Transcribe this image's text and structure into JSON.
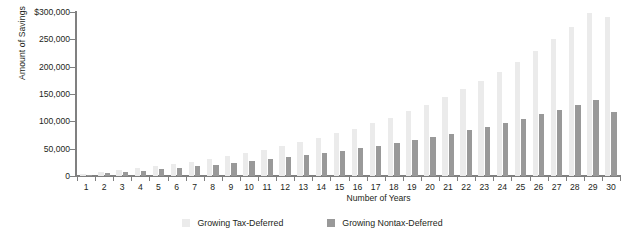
{
  "chart_data": {
    "type": "bar",
    "title": "",
    "xlabel": "Number of Years",
    "ylabel": "Amount of Savings",
    "ylim": [
      0,
      300000
    ],
    "ytick_labels": [
      "$300,000",
      "250,000",
      "200,000",
      "150,000",
      "100,000",
      "50,000",
      "0"
    ],
    "ytick_values": [
      300000,
      250000,
      200000,
      150000,
      100000,
      50000,
      0
    ],
    "grid": false,
    "legend_position": "bottom",
    "categories": [
      "1",
      "2",
      "3",
      "4",
      "5",
      "6",
      "7",
      "8",
      "9",
      "10",
      "11",
      "12",
      "13",
      "14",
      "15",
      "16",
      "17",
      "18",
      "19",
      "20",
      "21",
      "22",
      "23",
      "24",
      "25",
      "26",
      "27",
      "28",
      "29",
      "30"
    ],
    "series": [
      {
        "name": "Growing Tax-Deferred",
        "color": "#ebebeb",
        "values": [
          5500,
          11400,
          17700,
          24500,
          31700,
          39400,
          47600,
          56400,
          65700,
          75600,
          86200,
          97500,
          109500,
          122200,
          135800,
          150200,
          165500,
          181800,
          199100,
          217500,
          237000,
          257700,
          279800,
          303200,
          328100,
          354500,
          382600,
          412400,
          444100,
          477700
        ]
      },
      {
        "name": "Growing Nontax-Deferred",
        "color": "#999999",
        "values": [
          5300,
          10900,
          16700,
          22800,
          29200,
          35900,
          42900,
          50200,
          57900,
          65900,
          74300,
          83000,
          92200,
          101800,
          111800,
          122300,
          133300,
          144800,
          156800,
          169400,
          182600,
          196400,
          210800,
          225900,
          241700,
          258300,
          275600,
          293700,
          312700,
          332500
        ]
      }
    ],
    "rendered_series": [
      {
        "name": "Growing Tax-Deferred",
        "values": [
          4000,
          8000,
          12500,
          17000,
          22000,
          27500,
          33500,
          40000,
          47000,
          55000,
          63500,
          73000,
          83000,
          94000,
          105500,
          118000,
          131500,
          146000,
          161500,
          178000,
          196000,
          215000,
          235000,
          256000,
          279000,
          303000,
          329000,
          356000,
          385000,
          416000
        ]
      },
      {
        "name": "Growing Nontax-Deferred",
        "values": [
          3000,
          6000,
          9500,
          13000,
          16500,
          20500,
          24500,
          29000,
          33500,
          38500,
          43500,
          49000,
          54500,
          60500,
          66500,
          73000,
          80000,
          87000,
          94500,
          102500,
          110500,
          119000,
          128000,
          137500,
          147000,
          157000,
          167500,
          178500,
          190000,
          202000
        ]
      }
    ],
    "bar_pixel_series": [
      {
        "name": "Growing Tax-Deferred",
        "values": [
          3500,
          6500,
          9500,
          13000,
          16500,
          21000,
          25500,
          30500,
          36000,
          42000,
          48500,
          56000,
          64000,
          72500,
          82000,
          92000,
          103000,
          115000,
          128000,
          142000,
          157000,
          174000,
          192000,
          211000,
          232000,
          255000,
          280000,
          307000,
          336000,
          290000
        ]
      },
      {
        "name": "Growing Nontax-Deferred",
        "values": [
          2500,
          5000,
          7500,
          10000,
          13000,
          16000,
          19500,
          23000,
          27000,
          31000,
          35500,
          40000,
          45000,
          50500,
          56000,
          62000,
          68500,
          75500,
          82500,
          90500,
          98500,
          107000,
          116000,
          126000,
          136000,
          147000,
          159000,
          171000,
          184000,
          118000
        ]
      }
    ],
    "plot_values": {
      "tax_deferred": [
        3800,
        7000,
        10400,
        13900,
        17800,
        21900,
        26400,
        31200,
        36400,
        42000,
        48100,
        54700,
        61800,
        69500,
        77800,
        86800,
        96500,
        107000,
        118400,
        130700,
        144000,
        158400,
        174000,
        190800,
        209100,
        228800,
        250200,
        273300,
        298300,
        290000
      ],
      "nontax_deferred": [
        2600,
        5100,
        7500,
        9900,
        12500,
        15200,
        18000,
        21000,
        24100,
        27400,
        30800,
        34500,
        38300,
        42300,
        46600,
        51100,
        55800,
        60800,
        66100,
        71700,
        77600,
        83900,
        90500,
        97500,
        104900,
        112800,
        121100,
        129900,
        139200,
        118000
      ]
    }
  },
  "legend": {
    "items": [
      {
        "label": "Growing Tax-Deferred",
        "color": "#ebebeb"
      },
      {
        "label": "Growing Nontax-Deferred",
        "color": "#999999"
      }
    ]
  },
  "axis": {
    "y_title": "Amount of Savings",
    "x_title": "Number of Years"
  }
}
